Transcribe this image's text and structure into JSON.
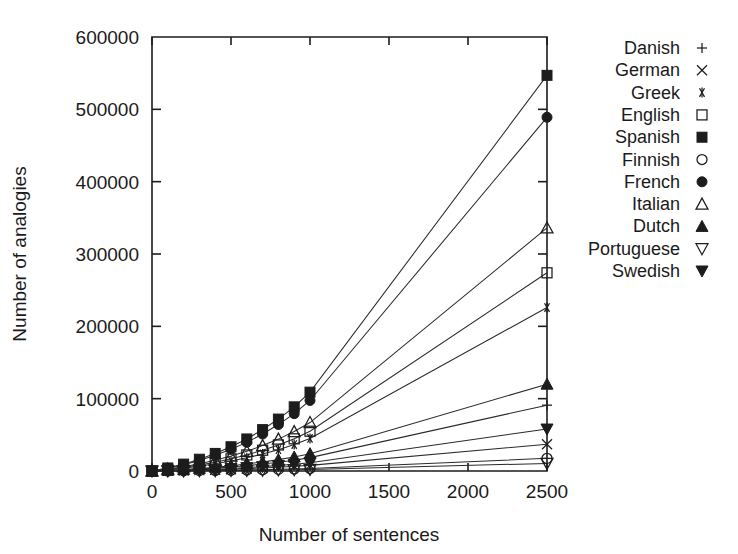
{
  "chart_data": {
    "type": "line",
    "title": "",
    "xlabel": "Number of sentences",
    "ylabel": "Number of analogies",
    "xlim": [
      0,
      2500
    ],
    "ylim": [
      0,
      600000
    ],
    "xticks": [
      0,
      500,
      1000,
      1500,
      2000,
      2500
    ],
    "xtick_labels": [
      "0",
      "500",
      "1000",
      "1500",
      "2000",
      "2500"
    ],
    "yticks": [
      0,
      100000,
      200000,
      300000,
      400000,
      500000,
      600000
    ],
    "ytick_labels": [
      "0",
      "100000",
      "200000",
      "300000",
      "400000",
      "500000",
      "600000"
    ],
    "grid": false,
    "legend_position": "right",
    "x": [
      0,
      100,
      200,
      300,
      400,
      500,
      600,
      700,
      800,
      900,
      1000,
      2500
    ],
    "series": [
      {
        "name": "Danish",
        "marker": "plus",
        "values": [
          0,
          700,
          1600,
          2700,
          4000,
          5500,
          7300,
          9600,
          12000,
          15000,
          18500,
          91000
        ]
      },
      {
        "name": "German",
        "marker": "cross",
        "values": [
          0,
          300,
          700,
          1200,
          1800,
          2500,
          3300,
          4200,
          5300,
          6500,
          7800,
          37000
        ]
      },
      {
        "name": "Greek",
        "marker": "asterisk",
        "values": [
          0,
          1700,
          3900,
          6700,
          10000,
          13800,
          18200,
          23500,
          29500,
          36500,
          45000,
          226000
        ]
      },
      {
        "name": "English",
        "marker": "open-square",
        "values": [
          0,
          2100,
          4800,
          8200,
          12200,
          16800,
          22200,
          28700,
          36000,
          44500,
          55000,
          274000
        ]
      },
      {
        "name": "Spanish",
        "marker": "filled-square",
        "values": [
          0,
          4200,
          9500,
          16300,
          24300,
          33500,
          44300,
          57200,
          71800,
          88700,
          109000,
          547000
        ]
      },
      {
        "name": "Finnish",
        "marker": "open-circle",
        "values": [
          0,
          130,
          300,
          520,
          780,
          1070,
          1420,
          1830,
          2300,
          2840,
          3500,
          17500
        ]
      },
      {
        "name": "French",
        "marker": "filled-circle",
        "values": [
          0,
          3750,
          8500,
          14600,
          21700,
          30000,
          39600,
          51100,
          64200,
          79300,
          97500,
          489000
        ]
      },
      {
        "name": "Italian",
        "marker": "open-triangle-up",
        "values": [
          0,
          2580,
          5850,
          10000,
          14900,
          20600,
          27200,
          35100,
          44100,
          54500,
          67000,
          336000
        ]
      },
      {
        "name": "Dutch",
        "marker": "filled-triangle-up",
        "values": [
          0,
          920,
          2080,
          3570,
          5320,
          7350,
          9700,
          12500,
          15700,
          19400,
          24000,
          120000
        ]
      },
      {
        "name": "Portuguese",
        "marker": "open-triangle-down",
        "values": [
          0,
          80,
          180,
          310,
          460,
          640,
          840,
          1090,
          1370,
          1690,
          2100,
          10500
        ]
      },
      {
        "name": "Swedish",
        "marker": "filled-triangle-down",
        "values": [
          0,
          440,
          1000,
          1720,
          2560,
          3540,
          4670,
          6030,
          7570,
          9350,
          11500,
          58000
        ]
      }
    ]
  },
  "legend": {
    "entries": [
      {
        "label": "Danish"
      },
      {
        "label": "German"
      },
      {
        "label": "Greek"
      },
      {
        "label": "English"
      },
      {
        "label": "Spanish"
      },
      {
        "label": "Finnish"
      },
      {
        "label": "French"
      },
      {
        "label": "Italian"
      },
      {
        "label": "Dutch"
      },
      {
        "label": "Portuguese"
      },
      {
        "label": "Swedish"
      }
    ]
  },
  "colors": {
    "background": "#ffffff",
    "ink": "#1c1c1c",
    "line": "#2a2a2a"
  }
}
